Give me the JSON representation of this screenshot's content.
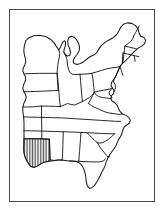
{
  "figure": {
    "title": "Map of the eastern United States",
    "description": "Black-and-white outline map of the eastern United States with state boundaries; one state in the lower-left (Louisiana) is filled with vertical hatching.",
    "background_color": "#ffffff",
    "line_color": "#1a1a1a",
    "frame": {
      "name": "map-border",
      "color": "#4a4a4a",
      "thickness_px": 1.5,
      "x": 9,
      "y": 9,
      "width": 146,
      "height": 193
    }
  },
  "map": {
    "region_label": "Eastern United States",
    "projection_note": "",
    "fill_color": "#ffffff",
    "outline_color": "#1a1a1a",
    "highlight": {
      "name": "Louisiana",
      "pattern": "vertical-hatch",
      "pattern_color": "#1a1a1a",
      "pattern_spacing_px": 1.6
    },
    "states": [
      "Wisconsin",
      "Michigan",
      "Iowa",
      "Illinois",
      "Indiana",
      "Ohio",
      "Pennsylvania",
      "New York",
      "Vermont",
      "New Hampshire",
      "Maine",
      "Massachusetts",
      "Rhode Island",
      "Connecticut",
      "New Jersey",
      "Delaware",
      "Maryland",
      "West Virginia",
      "Virginia",
      "Kentucky",
      "Tennessee",
      "North Carolina",
      "South Carolina",
      "Georgia",
      "Florida",
      "Alabama",
      "Mississippi",
      "Louisiana",
      "Arkansas",
      "Missouri"
    ]
  }
}
